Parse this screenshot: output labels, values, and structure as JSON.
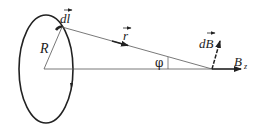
{
  "diagram": {
    "labels": {
      "current_element": "dl",
      "radius": "R",
      "position_vector": "r",
      "field_element": "dB",
      "axial_field": "B",
      "axial_field_subscript": "z",
      "angle": "φ"
    },
    "colors": {
      "stroke": "#222222",
      "thin_line": "#555555",
      "background": "#ffffff"
    }
  }
}
